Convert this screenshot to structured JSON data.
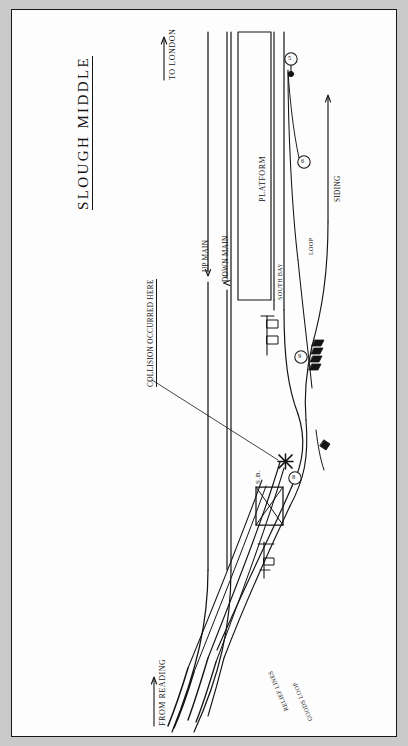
{
  "document": {
    "kind": "hand-drawn railway track diagram",
    "title": "SLOUGH MIDDLE",
    "annotation": "COLLISION OCCURRED HERE"
  },
  "directions": {
    "to_london": "TO LONDON",
    "from_reading": "FROM READING"
  },
  "tracks": {
    "up_main": "UP MAIN",
    "down_main": "DOWN MAIN",
    "south_bay": "SOUTH BAY",
    "loop": "LOOP",
    "siding": "SIDING",
    "relief_lines": "RELIEF LINES",
    "goods_loop": "GOODS LOOP"
  },
  "structures": {
    "platform": "PLATFORM",
    "signal_box": "S.B."
  },
  "signals": [
    {
      "id": "sig-1",
      "label": "5",
      "x": 278,
      "y": 50
    },
    {
      "id": "sig-2",
      "label": "6",
      "x": 292,
      "y": 152
    },
    {
      "id": "sig-3",
      "label": "9",
      "x": 289,
      "y": 347
    },
    {
      "id": "sig-4",
      "label": "8",
      "x": 283,
      "y": 468
    }
  ],
  "markers": {
    "collision_point": "X"
  },
  "colors": {
    "ink": "#141414",
    "paper": "#fdfdfd",
    "mat": "#c9c9c9"
  }
}
